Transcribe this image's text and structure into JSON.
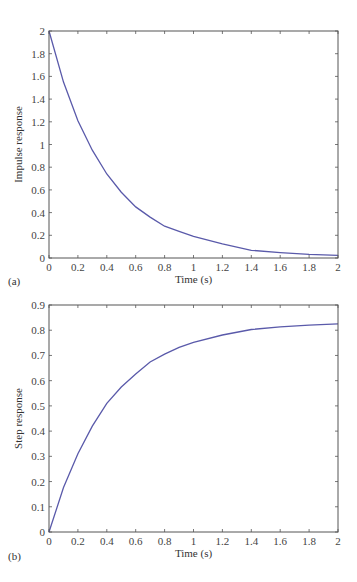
{
  "chart_data": [
    {
      "id": "a",
      "panel_label": "(a)",
      "type": "line",
      "title": "",
      "xlabel": "Time (s)",
      "ylabel": "Impulse response",
      "xlim": [
        0,
        2
      ],
      "ylim": [
        0,
        2
      ],
      "xticks": [
        0,
        0.2,
        0.4,
        0.6,
        0.8,
        1,
        1.2,
        1.4,
        1.6,
        1.8,
        2
      ],
      "xtick_labels": [
        "0",
        "0.2",
        "0.4",
        "0.6",
        "0.8",
        "1",
        "1.2",
        "1.4",
        "1.6",
        "1.8",
        "2"
      ],
      "yticks": [
        0,
        0.2,
        0.4,
        0.6,
        0.8,
        1,
        1.2,
        1.4,
        1.6,
        1.8,
        2
      ],
      "ytick_labels": [
        "0",
        "0.2",
        "0.4",
        "0.6",
        "0.8",
        "1",
        "1.2",
        "1.4",
        "1.6",
        "1.8",
        "2"
      ],
      "grid": false,
      "legend": null,
      "series": [
        {
          "name": "impulse response",
          "color": "#5a5aaa",
          "x": [
            0,
            0.1,
            0.2,
            0.3,
            0.4,
            0.5,
            0.6,
            0.7,
            0.8,
            0.9,
            1.0,
            1.2,
            1.4,
            1.6,
            1.8,
            2.0
          ],
          "y": [
            2.0,
            1.55,
            1.21,
            0.95,
            0.74,
            0.58,
            0.45,
            0.36,
            0.28,
            0.235,
            0.19,
            0.125,
            0.068,
            0.048,
            0.033,
            0.024
          ]
        }
      ]
    },
    {
      "id": "b",
      "panel_label": "(b)",
      "type": "line",
      "title": "",
      "xlabel": "Time (s)",
      "ylabel": "Step response",
      "xlim": [
        0,
        2
      ],
      "ylim": [
        0,
        0.9
      ],
      "xticks": [
        0,
        0.2,
        0.4,
        0.6,
        0.8,
        1,
        1.2,
        1.4,
        1.6,
        1.8,
        2
      ],
      "xtick_labels": [
        "0",
        "0.2",
        "0.4",
        "0.6",
        "0.8",
        "1",
        "1.2",
        "1.4",
        "1.6",
        "1.8",
        "2"
      ],
      "yticks": [
        0,
        0.1,
        0.2,
        0.3,
        0.4,
        0.5,
        0.6,
        0.7,
        0.8,
        0.9
      ],
      "ytick_labels": [
        "0",
        "0.1",
        "0.2",
        "0.3",
        "0.4",
        "0.5",
        "0.6",
        "0.7",
        "0.8",
        "0.9"
      ],
      "grid": false,
      "legend": null,
      "series": [
        {
          "name": "step response",
          "color": "#5a5aaa",
          "x": [
            0,
            0.1,
            0.2,
            0.3,
            0.4,
            0.5,
            0.6,
            0.7,
            0.8,
            0.9,
            1.0,
            1.2,
            1.4,
            1.6,
            1.8,
            2.0
          ],
          "y": [
            0,
            0.176,
            0.31,
            0.42,
            0.51,
            0.575,
            0.627,
            0.674,
            0.705,
            0.732,
            0.752,
            0.781,
            0.803,
            0.813,
            0.82,
            0.825
          ]
        }
      ]
    }
  ]
}
